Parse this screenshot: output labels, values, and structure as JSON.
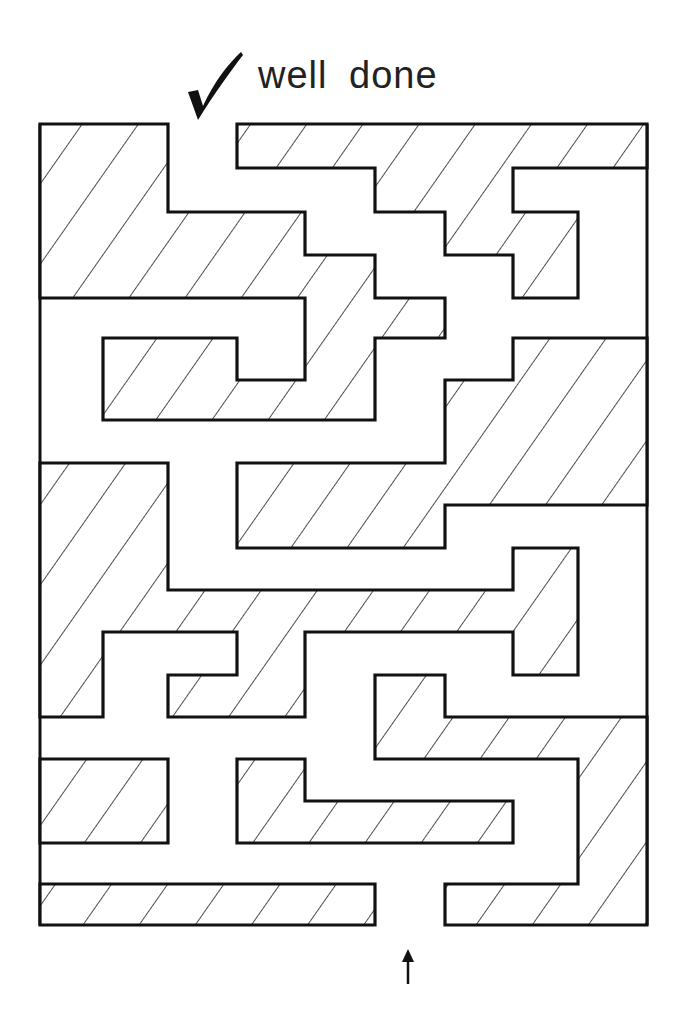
{
  "header": {
    "caption": "well done",
    "check_icon": "checkmark-icon"
  },
  "maze": {
    "entrance_marker": "up-arrow-icon",
    "fill_pattern": "diagonal-hatch",
    "line_color": "#111111",
    "background_color": "#ffffff",
    "walls": [
      {
        "id": "wall-a",
        "points": "40,124 168,124 168,212 305,212 305,255 375,255 375,298 445,298 445,338 375,338 375,420 103,420 103,338 237,338 237,380 305,380 305,298 40,298"
      },
      {
        "id": "wall-b",
        "points": "237,124 647,124 647,168 513,168 513,212 578,212 578,298 513,298 513,255 445,255 445,212 375,212 375,168 237,168"
      },
      {
        "id": "wall-c",
        "points": "513,338 647,338 647,505 445,505 445,548 237,548 237,463 445,463 445,380 513,380"
      },
      {
        "id": "wall-d",
        "points": "40,463 168,463 168,590 513,590 513,548 578,548 578,675 513,675 513,632 305,632 305,717 168,717 168,675 237,675 237,632 103,632 103,717 40,717"
      },
      {
        "id": "wall-e",
        "points": "375,675 445,675 445,717 647,717 647,925 445,925 445,884 578,884 578,759 375,759"
      },
      {
        "id": "wall-f",
        "points": "40,759 168,759 168,843 40,843"
      },
      {
        "id": "wall-g",
        "points": "237,759 305,759 305,801 513,801 513,843 237,843"
      },
      {
        "id": "wall-h",
        "points": "40,884 375,884 375,925 40,925"
      }
    ]
  }
}
